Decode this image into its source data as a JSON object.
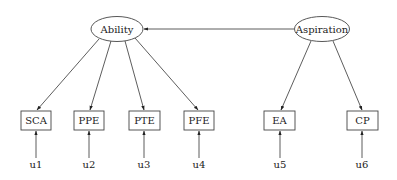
{
  "diagram": {
    "type": "structural-equation-model",
    "latent": [
      {
        "id": "ability",
        "label": "Ability",
        "cx": 117,
        "cy": 29,
        "rx": 26,
        "ry": 12.5
      },
      {
        "id": "aspiration",
        "label": "Aspiration",
        "cx": 322,
        "cy": 29,
        "rx": 27.5,
        "ry": 12.5
      }
    ],
    "observed": [
      {
        "id": "sca",
        "label": "SCA",
        "x": 21,
        "y": 111,
        "w": 30,
        "h": 19
      },
      {
        "id": "ppe",
        "label": "PPE",
        "x": 74,
        "y": 111,
        "w": 30,
        "h": 19
      },
      {
        "id": "pte",
        "label": "PTE",
        "x": 129,
        "y": 111,
        "w": 31,
        "h": 19
      },
      {
        "id": "pfe",
        "label": "PFE",
        "x": 184,
        "y": 111,
        "w": 30,
        "h": 19
      },
      {
        "id": "ea",
        "label": "EA",
        "x": 264,
        "y": 111,
        "w": 31,
        "h": 19
      },
      {
        "id": "cp",
        "label": "CP",
        "x": 347,
        "y": 111,
        "w": 31,
        "h": 19
      }
    ],
    "errors": [
      {
        "id": "u1",
        "label": "u1",
        "x": 36,
        "y": 168
      },
      {
        "id": "u2",
        "label": "u2",
        "x": 89,
        "y": 168
      },
      {
        "id": "u3",
        "label": "u3",
        "x": 144,
        "y": 168
      },
      {
        "id": "u4",
        "label": "u4",
        "x": 199,
        "y": 168
      },
      {
        "id": "u5",
        "label": "u5",
        "x": 280,
        "y": 168
      },
      {
        "id": "u6",
        "label": "u6",
        "x": 362,
        "y": 168
      }
    ],
    "edges": [
      {
        "from": "aspiration",
        "to": "ability",
        "x1": 294,
        "y1": 29,
        "x2": 144,
        "y2": 29
      },
      {
        "from": "ability",
        "to": "sca",
        "x1": 99,
        "y1": 39,
        "x2": 37,
        "y2": 110
      },
      {
        "from": "ability",
        "to": "ppe",
        "x1": 111,
        "y1": 41,
        "x2": 90,
        "y2": 110
      },
      {
        "from": "ability",
        "to": "pte",
        "x1": 125,
        "y1": 41,
        "x2": 144,
        "y2": 110
      },
      {
        "from": "ability",
        "to": "pfe",
        "x1": 135,
        "y1": 38,
        "x2": 198,
        "y2": 110
      },
      {
        "from": "aspiration",
        "to": "ea",
        "x1": 311,
        "y1": 41,
        "x2": 281,
        "y2": 110
      },
      {
        "from": "aspiration",
        "to": "cp",
        "x1": 333,
        "y1": 41,
        "x2": 362,
        "y2": 110
      },
      {
        "from": "u1",
        "to": "sca",
        "x1": 36,
        "y1": 158,
        "x2": 36,
        "y2": 131
      },
      {
        "from": "u2",
        "to": "ppe",
        "x1": 89,
        "y1": 158,
        "x2": 89,
        "y2": 131
      },
      {
        "from": "u3",
        "to": "pte",
        "x1": 144,
        "y1": 158,
        "x2": 144,
        "y2": 131
      },
      {
        "from": "u4",
        "to": "pfe",
        "x1": 199,
        "y1": 158,
        "x2": 199,
        "y2": 131
      },
      {
        "from": "u5",
        "to": "ea",
        "x1": 280,
        "y1": 158,
        "x2": 280,
        "y2": 131
      },
      {
        "from": "u6",
        "to": "cp",
        "x1": 362,
        "y1": 158,
        "x2": 362,
        "y2": 131
      }
    ]
  }
}
